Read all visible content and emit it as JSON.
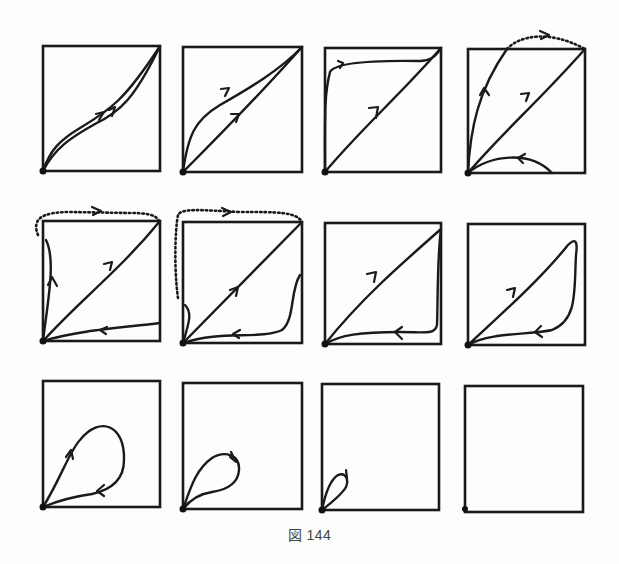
{
  "figure": {
    "caption": "図 144",
    "grid": {
      "rows": 3,
      "cols": 4
    },
    "panels": [
      {
        "id": 1,
        "row": 1,
        "col": 1,
        "description": "two nearly parallel curves from origin to top-right corner, both with forward arrows"
      },
      {
        "id": 2,
        "row": 1,
        "col": 2,
        "description": "two curves from origin to top-right corner diverging in middle, both with forward arrows"
      },
      {
        "id": 3,
        "row": 1,
        "col": 3,
        "description": "curve up left edge and along top to corner; diagonal with forward arrow"
      },
      {
        "id": 4,
        "row": 1,
        "col": 4,
        "description": "curve up exits top edge, dotted arc to top-right corner; diagonal with arrow; small return arc along bottom"
      },
      {
        "id": 5,
        "row": 2,
        "col": 1,
        "description": "dotted path from left edge over top to corner; diagonal; return path along bottom with arrow"
      },
      {
        "id": 6,
        "row": 2,
        "col": 2,
        "description": "dotted path from left edge over top to corner; diagonal; return from right edge along bottom"
      },
      {
        "id": 7,
        "row": 2,
        "col": 3,
        "description": "diagonal to corner, down right edge, return along bottom to origin"
      },
      {
        "id": 8,
        "row": 2,
        "col": 4,
        "description": "closed loop: diagonal up, down near right edge, return along bottom"
      },
      {
        "id": 9,
        "row": 3,
        "col": 1,
        "description": "medium teardrop loop from origin"
      },
      {
        "id": 10,
        "row": 3,
        "col": 2,
        "description": "smaller teardrop loop from origin"
      },
      {
        "id": 11,
        "row": 3,
        "col": 3,
        "description": "tiny teardrop loop at origin"
      },
      {
        "id": 12,
        "row": 3,
        "col": 4,
        "description": "empty square with origin dot only"
      }
    ]
  }
}
